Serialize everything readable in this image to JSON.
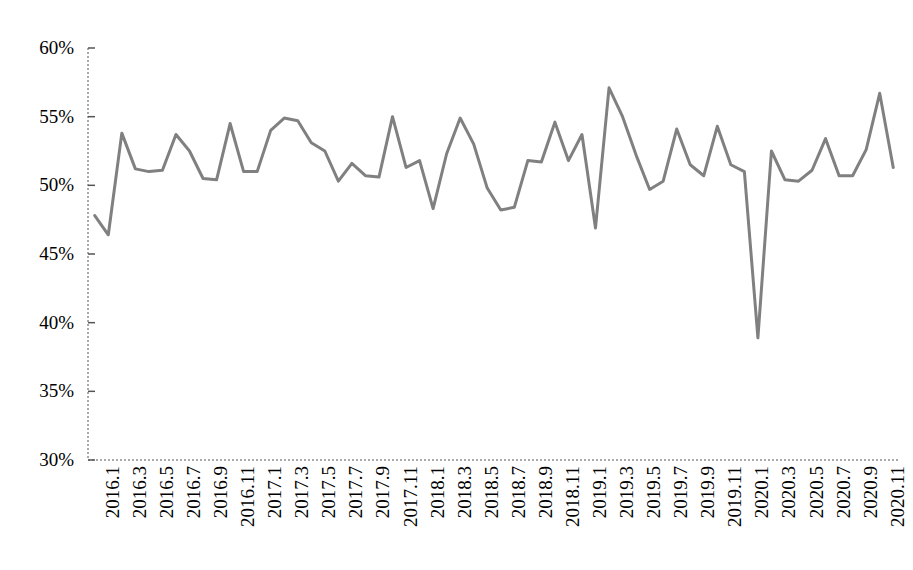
{
  "chart_data": {
    "type": "line",
    "title": "",
    "subtitle": "",
    "xlabel": "",
    "ylabel": "",
    "ylim": [
      30,
      60
    ],
    "y_tick_labels": [
      "60%",
      "55%",
      "50%",
      "45%",
      "40%",
      "35%",
      "30%"
    ],
    "y_ticks": [
      60,
      55,
      50,
      45,
      40,
      35,
      30
    ],
    "y_unit": "%",
    "grid": false,
    "legend": "none",
    "line_color": "#808080",
    "line_width": 3,
    "x_tick_labels": [
      "2016.1",
      "2016.3",
      "2016.5",
      "2016.7",
      "2016.9",
      "2016.11",
      "2017.1",
      "2017.3",
      "2017.5",
      "2017.7",
      "2017.9",
      "2017.11",
      "2018.1",
      "2018.3",
      "2018.5",
      "2018.7",
      "2018.9",
      "2018.11",
      "2019.1",
      "2019.3",
      "2019.5",
      "2019.7",
      "2019.9",
      "2019.11",
      "2020.1",
      "2020.3",
      "2020.5",
      "2020.7",
      "2020.9",
      "2020.11"
    ],
    "x_tick_step_months": 2,
    "categories": [
      "2016.1",
      "2016.2",
      "2016.3",
      "2016.4",
      "2016.5",
      "2016.6",
      "2016.7",
      "2016.8",
      "2016.9",
      "2016.10",
      "2016.11",
      "2016.12",
      "2017.1",
      "2017.2",
      "2017.3",
      "2017.4",
      "2017.5",
      "2017.6",
      "2017.7",
      "2017.8",
      "2017.9",
      "2017.10",
      "2017.11",
      "2017.12",
      "2018.1",
      "2018.2",
      "2018.3",
      "2018.4",
      "2018.5",
      "2018.6",
      "2018.7",
      "2018.8",
      "2018.9",
      "2018.10",
      "2018.11",
      "2018.12",
      "2019.1",
      "2019.2",
      "2019.3",
      "2019.4",
      "2019.5",
      "2019.6",
      "2019.7",
      "2019.8",
      "2019.9",
      "2019.10",
      "2019.11",
      "2019.12",
      "2020.1",
      "2020.2",
      "2020.3",
      "2020.4",
      "2020.5",
      "2020.6",
      "2020.7",
      "2020.8",
      "2020.9",
      "2020.10",
      "2020.11",
      "2020.12"
    ],
    "values": [
      47.8,
      46.4,
      53.8,
      51.2,
      51.0,
      51.1,
      53.7,
      52.5,
      50.5,
      50.4,
      54.5,
      51.0,
      51.0,
      54.0,
      54.9,
      54.7,
      53.1,
      52.5,
      50.3,
      51.6,
      50.7,
      50.6,
      55.0,
      51.3,
      51.8,
      48.3,
      52.3,
      54.9,
      53.0,
      49.8,
      48.2,
      48.4,
      51.8,
      51.7,
      54.6,
      51.8,
      53.7,
      46.9,
      57.1,
      55.0,
      52.2,
      49.7,
      50.3,
      54.1,
      51.5,
      50.7,
      54.3,
      51.5,
      51.0,
      38.9,
      52.5,
      50.4,
      50.3,
      51.1,
      53.4,
      50.7,
      50.7,
      52.6,
      56.7,
      51.3
    ],
    "annotations": [
      {
        "label": "COVID-19 trough",
        "category": "2020.2",
        "value": 38.9
      },
      {
        "label": "series maximum",
        "category": "2019.3",
        "value": 57.1
      },
      {
        "label": "series minimum",
        "category": "2020.2",
        "value": 38.9
      }
    ],
    "series": [
      {
        "name": "PMI",
        "values": [
          47.8,
          46.4,
          53.8,
          51.2,
          51.0,
          51.1,
          53.7,
          52.5,
          50.5,
          50.4,
          54.5,
          51.0,
          51.0,
          54.0,
          54.9,
          54.7,
          53.1,
          52.5,
          50.3,
          51.6,
          50.7,
          50.6,
          55.0,
          51.3,
          51.8,
          48.3,
          52.3,
          54.9,
          53.0,
          49.8,
          48.2,
          48.4,
          51.8,
          51.7,
          54.6,
          51.8,
          53.7,
          46.9,
          57.1,
          55.0,
          52.2,
          49.7,
          50.3,
          54.1,
          51.5,
          50.7,
          54.3,
          51.5,
          51.0,
          38.9,
          52.5,
          50.4,
          50.3,
          51.1,
          53.4,
          50.7,
          50.7,
          52.6,
          56.7,
          51.3
        ],
        "color": "#808080"
      }
    ]
  }
}
